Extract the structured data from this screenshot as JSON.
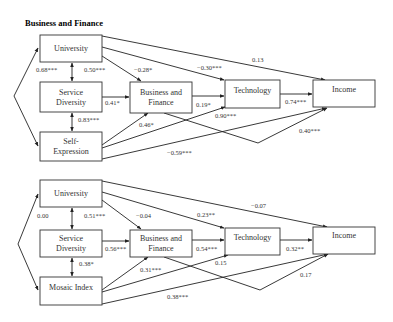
{
  "title": "Business and Finance",
  "panels": [
    {
      "id": "top",
      "nodes": {
        "university": {
          "label": [
            "University"
          ],
          "x": 40,
          "y": 35,
          "w": 62,
          "h": 27
        },
        "service_diversity": {
          "label": [
            "Service",
            "Diversity"
          ],
          "x": 40,
          "y": 82,
          "w": 62,
          "h": 30
        },
        "third": {
          "label": [
            "Self-",
            "Expression"
          ],
          "x": 40,
          "y": 132,
          "w": 62,
          "h": 29
        },
        "business_finance": {
          "label": [
            "Business and",
            "Finance"
          ],
          "x": 130,
          "y": 82,
          "w": 62,
          "h": 31
        },
        "technology": {
          "label": [
            "Technology"
          ],
          "x": 225,
          "y": 80,
          "w": 55,
          "h": 28
        },
        "income": {
          "label": [
            "Income"
          ],
          "x": 313,
          "y": 80,
          "w": 62,
          "h": 27
        }
      },
      "coefficients": {
        "univ_service": "0.68***",
        "univ_service_right": "0.50***",
        "univ_bf": "−0.28*",
        "univ_tech": "−0.30***",
        "univ_income": "0.13",
        "service_bf": "0.41*",
        "service_third": "0.83***",
        "bf_tech": "0.19*",
        "third_bf": "0.46*",
        "third_tech": "0.90***",
        "tech_income": "0.74***",
        "bf_income": "0.40***",
        "third_income": "−0.59***"
      }
    },
    {
      "id": "bottom",
      "nodes": {
        "university": {
          "label": [
            "University"
          ],
          "x": 40,
          "y": 180,
          "w": 62,
          "h": 27
        },
        "service_diversity": {
          "label": [
            "Service",
            "Diversity"
          ],
          "x": 40,
          "y": 230,
          "w": 62,
          "h": 27
        },
        "third": {
          "label": [
            "Mosaic Index"
          ],
          "x": 40,
          "y": 277,
          "w": 62,
          "h": 28
        },
        "business_finance": {
          "label": [
            "Business and",
            "Finance"
          ],
          "x": 130,
          "y": 230,
          "w": 62,
          "h": 27
        },
        "technology": {
          "label": [
            "Technology"
          ],
          "x": 225,
          "y": 228,
          "w": 55,
          "h": 27
        },
        "income": {
          "label": [
            "Income"
          ],
          "x": 313,
          "y": 227,
          "w": 62,
          "h": 27
        }
      },
      "coefficients": {
        "univ_service": "0.00",
        "univ_service_right": "0.51***",
        "univ_bf": "−0.04",
        "univ_tech": "0.23**",
        "univ_income": "−0.07",
        "service_bf": "0.56***",
        "service_third": "0.38*",
        "bf_tech": "0.54***",
        "third_bf": "0.31***",
        "third_tech": "0.15",
        "tech_income": "0.32**",
        "bf_income": "0.17",
        "third_income": "0.38***"
      }
    }
  ]
}
